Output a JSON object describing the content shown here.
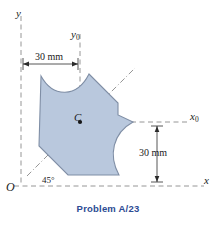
{
  "figure": {
    "caption": "Problem A/23",
    "caption_color": "#2c4b93",
    "shape_fill": "#b9c8dd",
    "shape_stroke": "#7f8ea5",
    "axis_color": "#8a8a8a",
    "axis_labels": {
      "y": "y",
      "x": "x",
      "y0": "y",
      "y0_sub": "0",
      "x0": "x",
      "x0_sub": "0",
      "origin": "O"
    },
    "centroid_label": "C",
    "dimensions": [
      {
        "name": "top-width",
        "text": "30 mm",
        "orientation": "horizontal"
      },
      {
        "name": "right-height",
        "text": "30 mm",
        "orientation": "vertical"
      }
    ],
    "angle": {
      "text": "45°",
      "value": 45
    }
  }
}
